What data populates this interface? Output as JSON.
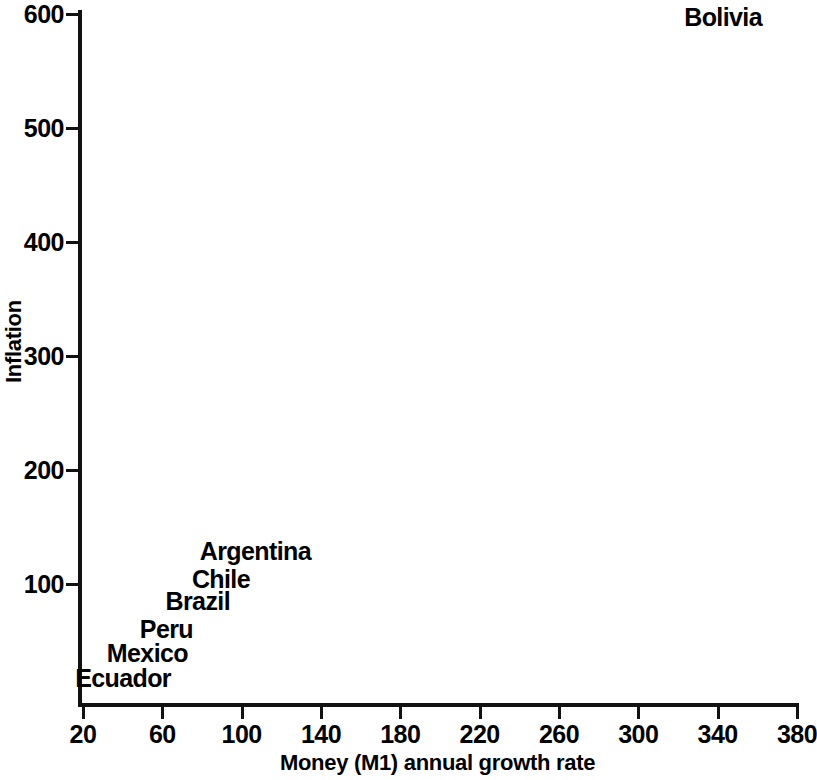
{
  "chart_data": {
    "type": "scatter",
    "title": "",
    "xlabel": "Money (M1) annual growth rate",
    "ylabel": "Inflation",
    "xlim": [
      20,
      380
    ],
    "ylim": [
      0,
      600
    ],
    "grid": false,
    "legend": "none",
    "marker_style": "text-label-only",
    "xticks": [
      20,
      60,
      100,
      140,
      180,
      220,
      260,
      300,
      340,
      380
    ],
    "xticklabels": [
      "20",
      "60",
      "100",
      "140",
      "180",
      "220",
      "260",
      "300",
      "340",
      "380"
    ],
    "yticks": [
      100,
      200,
      300,
      400,
      500,
      600
    ],
    "yticklabels": [
      "100",
      "200",
      "300",
      "400",
      "500",
      "600"
    ],
    "points": [
      {
        "label": "Bolivia",
        "x": 340,
        "y": 600,
        "px": 762,
        "py": 17
      },
      {
        "label": "Argentina",
        "x": 110,
        "y": 130,
        "px": 311,
        "py": 551
      },
      {
        "label": "Chile",
        "x": 100,
        "y": 105,
        "px": 250,
        "py": 579
      },
      {
        "label": "Brazil",
        "x": 88,
        "y": 83,
        "px": 230,
        "py": 601
      },
      {
        "label": "Peru",
        "x": 75,
        "y": 60,
        "px": 193,
        "py": 629
      },
      {
        "label": "Mexico",
        "x": 62,
        "y": 44,
        "px": 188,
        "py": 653
      },
      {
        "label": "Ecuador",
        "x": 45,
        "y": 25,
        "px": 171,
        "py": 678
      }
    ]
  },
  "figure": {
    "background_color": "#ffffff",
    "ink_color": "#111111"
  }
}
